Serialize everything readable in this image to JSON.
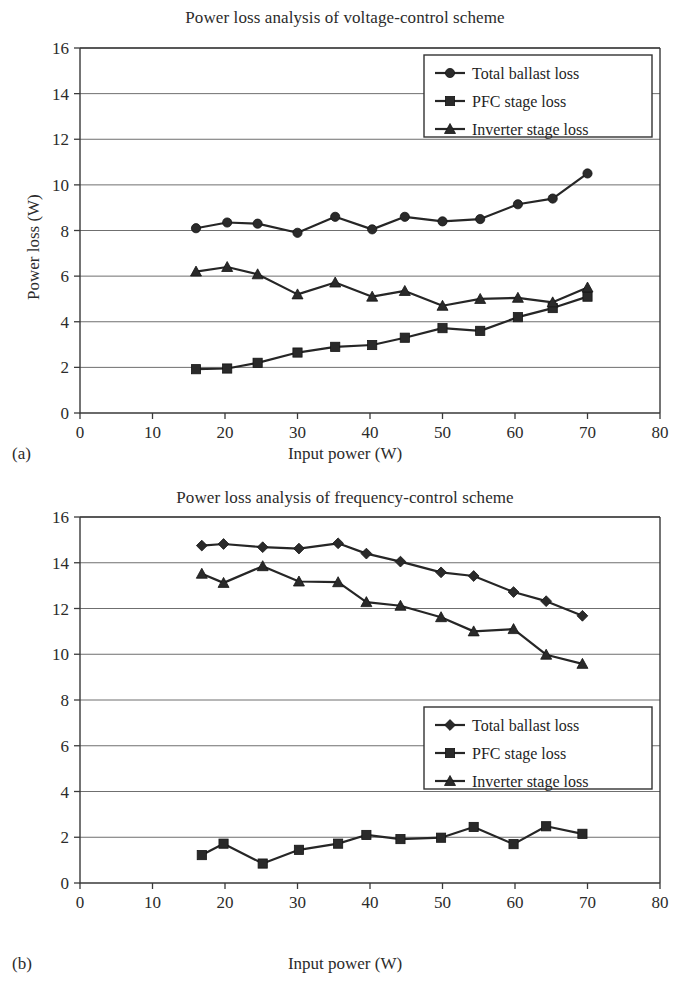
{
  "figures": [
    {
      "panel_label": "(a)",
      "title": "Power loss analysis of voltage-control scheme",
      "xlabel": "Input power (W)",
      "ylabel": "Power loss (W)"
    },
    {
      "panel_label": "(b)",
      "title": "Power loss analysis of frequency-control scheme",
      "xlabel": "Input power (W)",
      "ylabel": "Power loss (W)"
    }
  ],
  "legend": {
    "total_ballast": "Total ballast loss",
    "pfc_stage": "PFC stage loss",
    "inverter_stage": "Inverter stage loss"
  },
  "colors": {
    "line": "#262626",
    "marker": "#2a2a2a",
    "grid": "#6f6f6f",
    "frame": "#3a3a3a",
    "background": "#ffffff"
  },
  "chart_data": [
    {
      "type": "line",
      "title": "Power loss analysis of voltage-control scheme",
      "panel": "(a)",
      "xlabel": "Input power (W)",
      "ylabel": "Power loss (W)",
      "xlim": [
        0,
        80
      ],
      "ylim": [
        0,
        16
      ],
      "xticks": [
        0,
        10,
        20,
        30,
        40,
        50,
        60,
        70,
        80
      ],
      "yticks": [
        0,
        2,
        4,
        6,
        8,
        10,
        12,
        14,
        16
      ],
      "grid": true,
      "legend_position": "top-right",
      "series": [
        {
          "name": "Total ballast loss",
          "marker": "circle",
          "x": [
            16.0,
            20.3,
            24.5,
            30.0,
            35.2,
            40.3,
            44.8,
            50.0,
            55.2,
            60.4,
            65.2,
            70.0
          ],
          "values": [
            8.1,
            8.35,
            8.3,
            7.9,
            8.6,
            8.05,
            8.6,
            8.4,
            8.5,
            9.15,
            9.4,
            10.5
          ]
        },
        {
          "name": "PFC stage loss",
          "marker": "square",
          "x": [
            16.0,
            20.3,
            24.5,
            30.0,
            35.2,
            40.3,
            44.8,
            50.0,
            55.2,
            60.4,
            65.2,
            70.0
          ],
          "values": [
            1.92,
            1.95,
            2.2,
            2.65,
            2.9,
            2.98,
            3.3,
            3.72,
            3.6,
            4.2,
            4.6,
            5.1
          ]
        },
        {
          "name": "Inverter stage loss",
          "marker": "triangle",
          "x": [
            16.0,
            20.3,
            24.5,
            30.0,
            35.2,
            40.3,
            44.8,
            50.0,
            55.2,
            60.4,
            65.2,
            70.0
          ],
          "values": [
            6.2,
            6.4,
            6.08,
            5.2,
            5.72,
            5.1,
            5.35,
            4.7,
            5.0,
            5.05,
            4.85,
            5.5
          ]
        }
      ]
    },
    {
      "type": "line",
      "title": "Power loss analysis of frequency-control scheme",
      "panel": "(b)",
      "xlabel": "Input power (W)",
      "ylabel": "Power loss (W)",
      "xlim": [
        0,
        80
      ],
      "ylim": [
        0,
        16
      ],
      "xticks": [
        0,
        10,
        20,
        30,
        40,
        50,
        60,
        70,
        80
      ],
      "yticks": [
        0,
        2,
        4,
        6,
        8,
        10,
        12,
        14,
        16
      ],
      "grid": true,
      "legend_position": "middle-right",
      "series": [
        {
          "name": "Total ballast loss",
          "marker": "diamond",
          "x": [
            16.8,
            19.8,
            25.2,
            30.2,
            35.6,
            39.5,
            44.2,
            49.8,
            54.3,
            59.8,
            64.3,
            69.3
          ],
          "values": [
            14.75,
            14.82,
            14.68,
            14.62,
            14.85,
            14.4,
            14.05,
            13.58,
            13.42,
            12.72,
            12.32,
            11.68
          ]
        },
        {
          "name": "PFC stage loss",
          "marker": "square",
          "x": [
            16.8,
            19.8,
            25.2,
            30.2,
            35.6,
            39.5,
            44.2,
            49.8,
            54.3,
            59.8,
            64.3,
            69.3
          ],
          "values": [
            1.22,
            1.72,
            0.85,
            1.45,
            1.72,
            2.1,
            1.92,
            1.98,
            2.45,
            1.7,
            2.48,
            2.15
          ]
        },
        {
          "name": "Inverter stage loss",
          "marker": "triangle",
          "x": [
            16.8,
            19.8,
            25.2,
            30.2,
            35.6,
            39.5,
            44.2,
            49.8,
            54.3,
            59.8,
            64.3,
            69.3
          ],
          "values": [
            13.52,
            13.12,
            13.85,
            13.18,
            13.15,
            12.28,
            12.12,
            11.62,
            11.0,
            11.1,
            9.98,
            9.58
          ]
        }
      ]
    }
  ]
}
